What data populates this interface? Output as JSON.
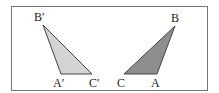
{
  "diagram": {
    "title": "",
    "frame": {
      "x": 11,
      "y": 6,
      "width": 196,
      "height": 84,
      "stroke": "#777777"
    },
    "triangles": [
      {
        "name": "A'B'C'",
        "fill": "#d3d3d3",
        "stroke": "#444444",
        "vertices": [
          {
            "label": "B′",
            "x": 43,
            "y": 25,
            "lx": 34,
            "ly": 21
          },
          {
            "label": "A′",
            "x": 61,
            "y": 74,
            "lx": 53,
            "ly": 87
          },
          {
            "label": "C′",
            "x": 92,
            "y": 74,
            "lx": 89,
            "ly": 87
          }
        ]
      },
      {
        "name": "ABC",
        "fill": "#8e8e8e",
        "stroke": "#444444",
        "vertices": [
          {
            "label": "B",
            "x": 175,
            "y": 26,
            "lx": 171,
            "ly": 22
          },
          {
            "label": "A",
            "x": 157,
            "y": 74,
            "lx": 151,
            "ly": 87
          },
          {
            "label": "C",
            "x": 124,
            "y": 74,
            "lx": 117,
            "ly": 87
          }
        ]
      }
    ]
  }
}
